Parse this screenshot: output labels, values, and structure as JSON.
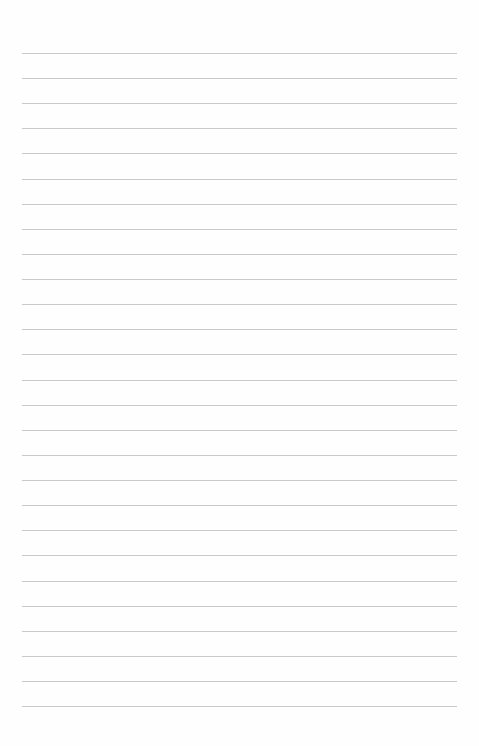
{
  "page": {
    "type": "blank lined notebook page",
    "line_count": 27,
    "first_line_y": 53,
    "line_spacing": 25.12,
    "line_left": 22,
    "line_right": 457,
    "line_color": "#c9c9c9",
    "background": "#fefefe"
  }
}
